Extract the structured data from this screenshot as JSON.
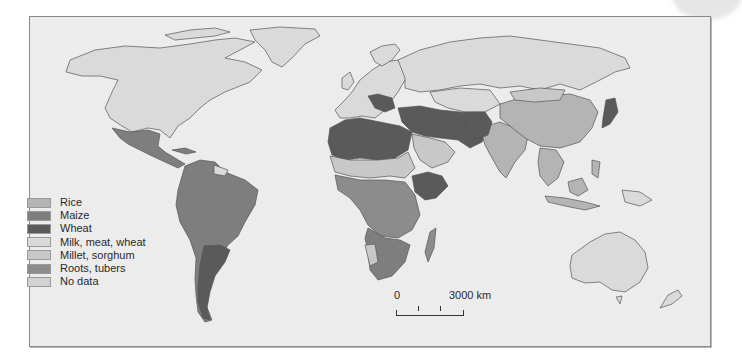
{
  "map": {
    "type": "choropleth world map",
    "subject": "Staple food by country",
    "background_color": "#ececec",
    "border_color": "#555555"
  },
  "legend": {
    "items": [
      {
        "label": "Rice",
        "color": "#b4b4b4"
      },
      {
        "label": "Maize",
        "color": "#7e7e7e"
      },
      {
        "label": "Wheat",
        "color": "#5a5a5a"
      },
      {
        "label": "Milk, meat, wheat",
        "color": "#dadada"
      },
      {
        "label": "Millet, sorghum",
        "color": "#c8c8c8"
      },
      {
        "label": "Roots, tubers",
        "color": "#8c8c8c"
      },
      {
        "label": "No data",
        "color": "#d2d2d2"
      }
    ]
  },
  "scale": {
    "start_label": "0",
    "end_label": "3000 km"
  },
  "regions": {
    "north_america": "Milk, meat, wheat",
    "greenland": "Milk, meat, wheat",
    "mexico_central_america": "Maize",
    "south_america": "Maize",
    "argentina": "Wheat",
    "europe": "Milk, meat, wheat",
    "balkans": "Wheat",
    "russia": "Milk, meat, wheat",
    "north_africa": "Wheat",
    "middle_east": "Wheat",
    "arabian_peninsula": "Millet, sorghum",
    "sahel": "Millet, sorghum",
    "ethiopia": "Wheat",
    "central_africa": "Roots, tubers",
    "southern_africa": "Maize",
    "south_asia": "Rice",
    "china": "Rice",
    "japan": "Wheat",
    "southeast_asia": "Rice",
    "australia": "Milk, meat, wheat"
  }
}
